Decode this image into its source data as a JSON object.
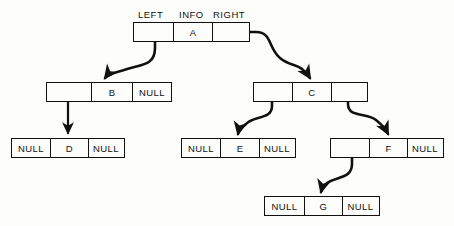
{
  "diagram": {
    "headers": [
      {
        "label": "LEFT",
        "x": 138,
        "y": 9
      },
      {
        "label": "INFO",
        "x": 180,
        "y": 9
      },
      {
        "label": "RIGHT",
        "x": 214,
        "y": 9
      }
    ],
    "null_label": "NULL",
    "nodes": [
      {
        "id": "node-a",
        "info": "A",
        "x": 133,
        "y": 22,
        "w": 117,
        "h": 20,
        "cells": [
          {
            "kind": "pointer",
            "name": "left",
            "text": "",
            "w": 39
          },
          {
            "kind": "info",
            "name": "info",
            "text": "A",
            "w": 39
          },
          {
            "kind": "pointer",
            "name": "right",
            "text": "",
            "w": 39
          }
        ]
      },
      {
        "id": "node-b",
        "info": "B",
        "x": 46,
        "y": 82,
        "w": 126,
        "h": 20,
        "cells": [
          {
            "kind": "pointer",
            "name": "left",
            "text": "",
            "w": 44
          },
          {
            "kind": "info",
            "name": "info",
            "text": "B",
            "w": 41
          },
          {
            "kind": "null",
            "name": "right",
            "text": "NULL",
            "w": 41
          }
        ]
      },
      {
        "id": "node-c",
        "info": "C",
        "x": 253,
        "y": 82,
        "w": 115,
        "h": 20,
        "cells": [
          {
            "kind": "pointer",
            "name": "left",
            "text": "",
            "w": 38
          },
          {
            "kind": "info",
            "name": "info",
            "text": "C",
            "w": 39
          },
          {
            "kind": "pointer",
            "name": "right",
            "text": "",
            "w": 38
          }
        ]
      },
      {
        "id": "node-d",
        "info": "D",
        "x": 11,
        "y": 138,
        "w": 114,
        "h": 20,
        "cells": [
          {
            "kind": "null",
            "name": "left",
            "text": "NULL",
            "w": 38
          },
          {
            "kind": "info",
            "name": "info",
            "text": "D",
            "w": 38
          },
          {
            "kind": "null",
            "name": "right",
            "text": "NULL",
            "w": 38
          }
        ]
      },
      {
        "id": "node-e",
        "info": "E",
        "x": 181,
        "y": 138,
        "w": 115,
        "h": 20,
        "cells": [
          {
            "kind": "null",
            "name": "left",
            "text": "NULL",
            "w": 38
          },
          {
            "kind": "info",
            "name": "info",
            "text": "E",
            "w": 39
          },
          {
            "kind": "null",
            "name": "right",
            "text": "NULL",
            "w": 38
          }
        ]
      },
      {
        "id": "node-f",
        "info": "F",
        "x": 330,
        "y": 138,
        "w": 114,
        "h": 20,
        "cells": [
          {
            "kind": "pointer",
            "name": "left",
            "text": "",
            "w": 38
          },
          {
            "kind": "info",
            "name": "info",
            "text": "F",
            "w": 38
          },
          {
            "kind": "null",
            "name": "right",
            "text": "NULL",
            "w": 38
          }
        ]
      },
      {
        "id": "node-g",
        "info": "G",
        "x": 264,
        "y": 196,
        "w": 116,
        "h": 20,
        "cells": [
          {
            "kind": "null",
            "name": "left",
            "text": "NULL",
            "w": 39
          },
          {
            "kind": "info",
            "name": "info",
            "text": "G",
            "w": 38
          },
          {
            "kind": "null",
            "name": "right",
            "text": "NULL",
            "w": 39
          }
        ]
      }
    ],
    "links": [
      {
        "id": "link-a-left",
        "from": "node-a.left",
        "to": "node-b",
        "style": "curve"
      },
      {
        "id": "link-a-right",
        "from": "node-a.right",
        "to": "node-c",
        "style": "curve"
      },
      {
        "id": "link-b-left",
        "from": "node-b.left",
        "to": "node-d",
        "style": "straight"
      },
      {
        "id": "link-c-left",
        "from": "node-c.left",
        "to": "node-e",
        "style": "curve"
      },
      {
        "id": "link-c-right",
        "from": "node-c.right",
        "to": "node-f",
        "style": "curve"
      },
      {
        "id": "link-f-left",
        "from": "node-f.left",
        "to": "node-g",
        "style": "curve"
      }
    ],
    "colors": {
      "stroke": "#111111",
      "background": "#fdfdfb",
      "text": "#111111"
    }
  }
}
